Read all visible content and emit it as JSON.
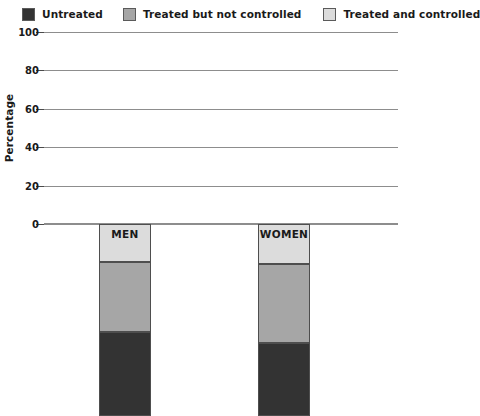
{
  "chart_data": {
    "type": "bar",
    "stacked": true,
    "title": "",
    "xlabel": "",
    "ylabel": "Percentage",
    "ylim": [
      0,
      100
    ],
    "yticks": [
      0,
      20,
      40,
      60,
      80,
      100
    ],
    "grid": true,
    "legend_position": "top",
    "categories": [
      "MEN",
      "WOMEN"
    ],
    "series": [
      {
        "name": "Untreated",
        "color": "#333333",
        "values": [
          44,
          38
        ]
      },
      {
        "name": "Treated but not controlled",
        "color": "#a6a6a6",
        "values": [
          36,
          41
        ]
      },
      {
        "name": "Treated and controlled",
        "color": "#dcdcdc",
        "values": [
          20,
          21
        ]
      }
    ]
  },
  "colors": {
    "untreated": "#333333",
    "treated_not_controlled": "#a6a6a6",
    "treated_controlled": "#dcdcdc",
    "gridline": "#8d8d8d",
    "outline": "#4e4e4e",
    "text": "#1a1a1a"
  }
}
